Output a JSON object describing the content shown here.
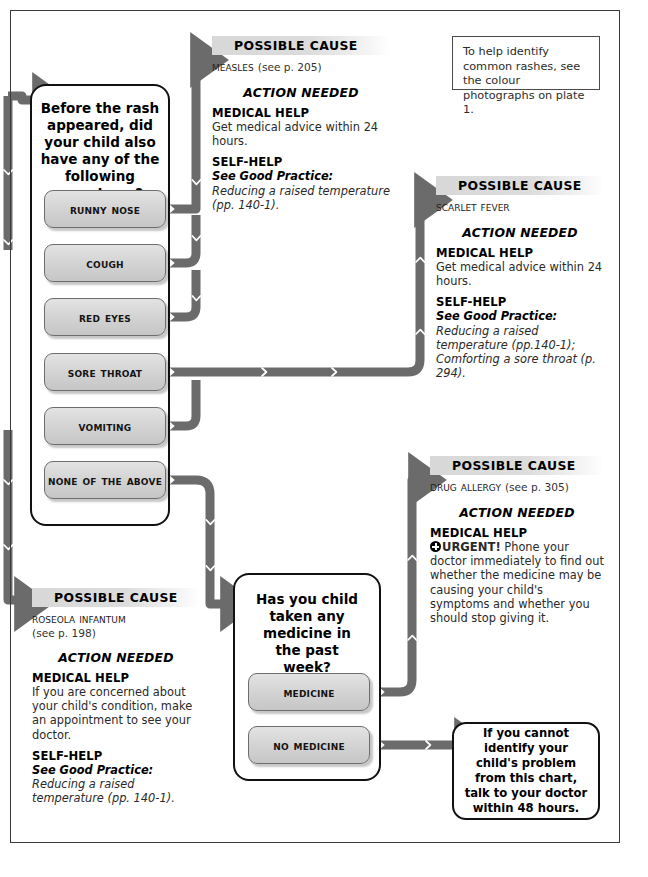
{
  "diagram": {
    "type": "medical-symptom-flowchart"
  },
  "note_box": {
    "text": "To help identify common rashes, see the colour photographs on plate 1."
  },
  "question_main": {
    "title": "Before the rash appeared, did your child also have any of the following symptoms?",
    "options": [
      {
        "label": "Runny nose"
      },
      {
        "label": "Cough"
      },
      {
        "label": "Red eyes"
      },
      {
        "label": "Sore throat"
      },
      {
        "label": "Vomiting"
      },
      {
        "label": "None of the above"
      }
    ]
  },
  "question_medicine": {
    "title": "Has you child taken any medicine in the past week?",
    "options": [
      {
        "label": "Medicine"
      },
      {
        "label": "No medicine"
      }
    ]
  },
  "causes": {
    "measles": {
      "header": "POSSIBLE CAUSE",
      "name": "Measles",
      "page_ref": "(see p. 205)",
      "action_header": "ACTION NEEDED",
      "medical_label": "MEDICAL HELP",
      "medical_text": "Get medical advice within 24 hours.",
      "self_label": "SELF-HELP",
      "self_prefix": "See Good Practice:",
      "self_text": " Reducing a raised temperature (pp. 140-1)."
    },
    "scarlet_fever": {
      "header": "POSSIBLE CAUSE",
      "name": "Scarlet fever",
      "page_ref": "",
      "action_header": "ACTION NEEDED",
      "medical_label": "MEDICAL HELP",
      "medical_text": "Get medical advice within 24 hours.",
      "self_label": "SELF-HELP",
      "self_prefix": "See Good Practice:",
      "self_text": " Reducing a raised temperature (pp.140-1); Comforting a sore throat (p. 294)."
    },
    "drug_allergy": {
      "header": "POSSIBLE CAUSE",
      "name": "Drug allergy",
      "page_ref": "(see p. 305)",
      "action_header": "ACTION NEEDED",
      "medical_label": "MEDICAL HELP",
      "urgent_word": "URGENT!",
      "urgent_icon": "urgent-cross-icon",
      "medical_text": " Phone your doctor immediately to find out whether the medicine may be causing your child's symptoms and whether you should stop giving it."
    },
    "roseola": {
      "header": "POSSIBLE CAUSE",
      "name": "Roseola infantum",
      "page_ref": "(see p. 198)",
      "action_header": "ACTION NEEDED",
      "medical_label": "MEDICAL HELP",
      "medical_text": "If you are concerned about your child's condition, make an appointment to see your doctor.",
      "self_label": "SELF-HELP",
      "self_prefix": "See Good Practice:",
      "self_text": " Reducing a raised temperature (pp. 140-1)."
    }
  },
  "terminal": {
    "text": "If you cannot identify your child's problem from this chart, talk to your doctor within 48 hours."
  },
  "colors": {
    "arrow": "#6b6b6b",
    "button_top": "#e3e3e3",
    "button_bottom": "#c6c6c6",
    "header_band": "#d8d8d8",
    "outline": "#111111"
  }
}
